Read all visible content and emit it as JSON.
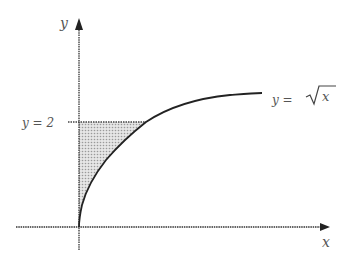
{
  "diagram": {
    "type": "function-region",
    "axes": {
      "x_label": "x",
      "y_label": "y"
    },
    "curve": {
      "label": "y = √x",
      "label_lhs": "y = ",
      "label_radicand": "x"
    },
    "horizontal_line": {
      "label": "y = 2"
    },
    "shaded_region": "region bounded by y-axis, y = 2, and y = √x",
    "colors": {
      "axis": "#333333",
      "curve": "#222222",
      "shade": "#cfcfcf",
      "label": "#555555"
    }
  }
}
